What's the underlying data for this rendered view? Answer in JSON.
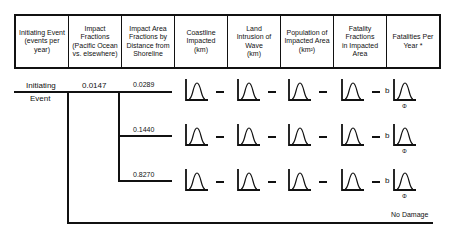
{
  "header": {
    "columns": [
      "Initiating Event\n(events per\nyear)",
      "Impact Fractions\n(Pacific Ocean\nvs. elsewhere)",
      "Impact Area\nFractions by\nDistance from\nShoreline",
      "Coastline\nImpacted\n(km)",
      "Land\nIntrusion of\nWave\n(km)",
      "Population of\nImpacted Area\n(km²)",
      "Fatality\nFractions\nin Impacted\nArea",
      "Fatalities Per\nYear *"
    ]
  },
  "tree": {
    "initiating_label_top": "Initiating",
    "initiating_label_bottom": "Event",
    "impact_fraction": "0.0147",
    "branches": [
      {
        "fraction": "0.0289"
      },
      {
        "fraction": "0.1440"
      },
      {
        "fraction": "0.8270"
      }
    ],
    "phi_symbol": "Φ",
    "b_symbol": "b",
    "no_damage": "No Damage"
  }
}
